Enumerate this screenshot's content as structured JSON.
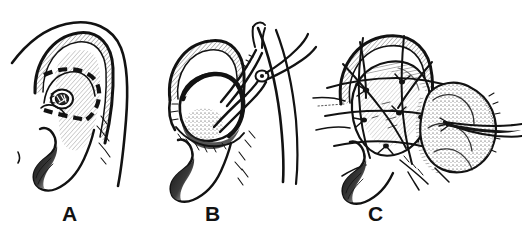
{
  "figure": {
    "background_color": "#ffffff",
    "ink_color": "#121212",
    "width": 522,
    "height": 236,
    "style": "black-and-white pen-and-ink line drawing"
  },
  "panels": [
    {
      "id": "A",
      "label": "A",
      "caption": "Ear with dashed incision outline around the concha",
      "parts": [
        "helix",
        "antihelix",
        "concha",
        "external-auditory-canal",
        "tragus",
        "lobule",
        "dashed-incision-line"
      ]
    },
    {
      "id": "B",
      "label": "B",
      "caption": "Conchal flap elevated and retracted with a hemostat clamp",
      "parts": [
        "helix",
        "elevated-conchal-flap",
        "stippled-graft-bed",
        "hemostat-clamp",
        "clamp-pivot-screw",
        "lobule"
      ]
    },
    {
      "id": "C",
      "label": "C",
      "caption": "Bolster sutures tied over the ear with packing mass and instrument tip",
      "parts": [
        "helix",
        "bolster-sutures",
        "suture-tails",
        "stippled-packing-bolster",
        "forceps-tip",
        "lobule"
      ]
    }
  ],
  "labels": {
    "a": "A",
    "b": "B",
    "c": "C"
  }
}
